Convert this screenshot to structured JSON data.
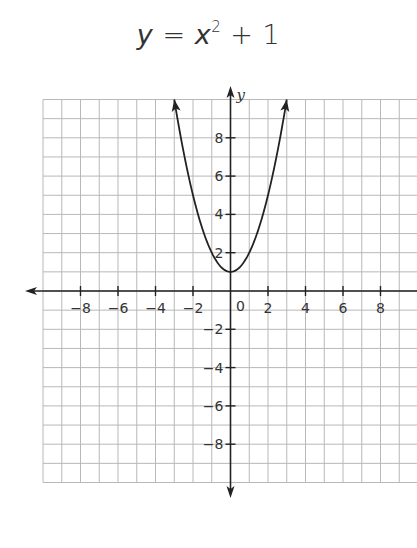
{
  "chart_data": {
    "type": "line",
    "title_parts": {
      "lhs": "y",
      "eq": " = ",
      "base": "x",
      "exp": "2",
      "rest": " + 1"
    },
    "equation": "y = x^2 + 1",
    "xlabel": "",
    "ylabel": "y",
    "xlim": [
      -10,
      10
    ],
    "ylim": [
      -10,
      10
    ],
    "grid": true,
    "grid_step": 1,
    "x_ticks": [
      -8,
      -6,
      -4,
      -2,
      2,
      4,
      6,
      8
    ],
    "y_ticks": [
      8,
      6,
      4,
      2,
      -2,
      -4,
      -6,
      -8
    ],
    "origin_label": "0",
    "series": [
      {
        "name": "y = x^2 + 1",
        "x": [
          -3,
          -2.5,
          -2,
          -1.5,
          -1,
          -0.5,
          0,
          0.5,
          1,
          1.5,
          2,
          2.5,
          3
        ],
        "y": [
          10,
          7.25,
          5,
          3.25,
          2,
          1.25,
          1,
          1.25,
          2,
          3.25,
          5,
          7.25,
          10
        ],
        "arrows_at_ends": true
      }
    ],
    "vertex": [
      0,
      1
    ],
    "colors": {
      "grid": "#b8b8b8",
      "axis": "#222222",
      "curve": "#222222",
      "text": "#333333"
    }
  }
}
